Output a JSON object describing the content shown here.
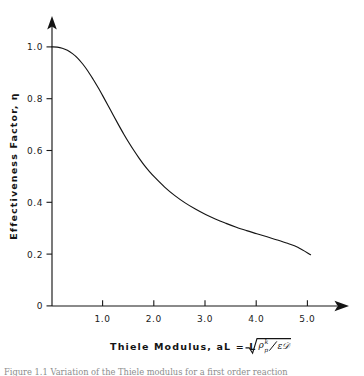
{
  "figure": {
    "background_color": "#ffffff",
    "ink_color": "#141414",
    "caption": "Figure 1.1  Variation of the Thiele modulus for a first order reaction"
  },
  "chart_data": {
    "type": "line",
    "title": "",
    "xlabel": "Thiele Modulus, aL = L",
    "ylabel": "Effectiveness Factor, η",
    "xlabel_formula": {
      "radicand_numerator_base": "ρ",
      "radicand_numerator_subscript": "p",
      "radicand_numerator_superscript": "k",
      "radicand_denominator": "ε𝒟",
      "rendered": "L √(ρₚᵏ / ε𝒟)"
    },
    "xlim": [
      0,
      5.4
    ],
    "ylim": [
      0,
      1.08
    ],
    "xticks": [
      1.0,
      2.0,
      3.0,
      4.0,
      5.0
    ],
    "xtick_labels": [
      "1.0",
      "2.0",
      "3.0",
      "4.0",
      "5.0"
    ],
    "yticks": [
      0,
      0.2,
      0.4,
      0.6,
      0.8,
      1.0
    ],
    "ytick_labels": [
      "0",
      "0.2",
      "0.4",
      "0.6",
      "0.8",
      "1.0"
    ],
    "origin_label": "0",
    "grid": false,
    "legend": false,
    "x_axis_arrow": true,
    "y_axis_arrow": true,
    "series": [
      {
        "name": "effectiveness factor",
        "color": "#141414",
        "x": [
          0.0,
          0.1,
          0.2,
          0.3,
          0.4,
          0.5,
          0.6,
          0.7,
          0.8,
          0.9,
          1.0,
          1.1,
          1.2,
          1.3,
          1.4,
          1.5,
          1.6,
          1.7,
          1.8,
          1.9,
          2.0,
          2.2,
          2.4,
          2.6,
          2.8,
          3.0,
          3.2,
          3.4,
          3.6,
          3.8,
          4.0,
          4.2,
          4.4,
          4.6,
          4.8,
          5.05
        ],
        "y": [
          1.0,
          0.999,
          0.995,
          0.987,
          0.974,
          0.957,
          0.934,
          0.907,
          0.876,
          0.843,
          0.808,
          0.772,
          0.735,
          0.699,
          0.664,
          0.631,
          0.6,
          0.571,
          0.544,
          0.52,
          0.498,
          0.459,
          0.426,
          0.398,
          0.374,
          0.353,
          0.335,
          0.319,
          0.304,
          0.291,
          0.279,
          0.267,
          0.255,
          0.242,
          0.227,
          0.198
        ]
      }
    ]
  }
}
